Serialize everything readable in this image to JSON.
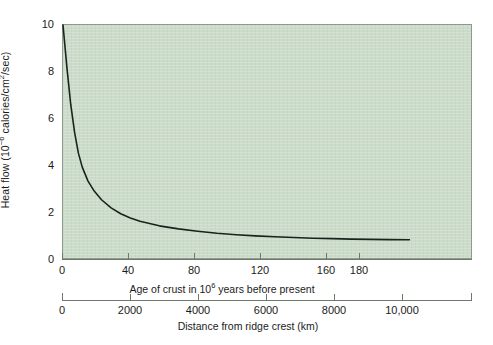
{
  "figure": {
    "background_color": "#ffffff",
    "plot_background_color": "#ccdccb",
    "curve_color": "#18231c",
    "axis_color": "#6d7a6c"
  },
  "chart_data": {
    "type": "line",
    "title": "",
    "xlabel": "Age of crust in 10^6 years before present",
    "ylabel": "Heat flow (10^-6 calories/cm^2/sec)",
    "xlim": [
      0,
      212
    ],
    "ylim": [
      0,
      10
    ],
    "grid": false,
    "legend": null,
    "x_axes": [
      {
        "name": "age",
        "label_plain": "Age of crust in 10",
        "label_sup": "6",
        "label_tail": " years before present",
        "label_full": "Age of crust in 10⁶ years before present",
        "unit": "10^6 years",
        "ticks": [
          0,
          40,
          80,
          120,
          160,
          180
        ],
        "tick_labels": [
          "0",
          "40",
          "80",
          "120",
          "160",
          "180"
        ],
        "range": [
          0,
          212
        ]
      },
      {
        "name": "distance",
        "label_full": "Distance from ridge crest (km)",
        "unit": "km",
        "ticks": [
          0,
          2000,
          4000,
          6000,
          8000,
          10000
        ],
        "tick_labels": [
          "0",
          "2000",
          "4000",
          "6000",
          "8000",
          "10,000"
        ],
        "range": [
          0,
          12100
        ]
      }
    ],
    "y_axis": {
      "label_plain": "Heat flow (10",
      "label_sup": "−6",
      "label_tail": " calories/cm",
      "label_sup2": "2",
      "label_tail2": "/sec)",
      "label_full": "Heat flow (10⁻⁶ calories/cm²/sec)",
      "ticks": [
        0,
        2,
        4,
        6,
        8,
        10
      ],
      "tick_labels": [
        "0",
        "2",
        "4",
        "6",
        "8",
        "10"
      ],
      "range": [
        0,
        10
      ]
    },
    "series": [
      {
        "name": "Heat flow vs age of crust",
        "x": [
          0,
          2,
          4,
          6,
          8,
          10,
          13,
          16,
          20,
          25,
          30,
          35,
          40,
          50,
          60,
          70,
          80,
          90,
          100,
          110,
          120,
          130,
          140,
          150,
          160,
          170,
          180
        ],
        "y": [
          10.0,
          8.2,
          6.6,
          5.4,
          4.5,
          3.9,
          3.3,
          2.9,
          2.5,
          2.15,
          1.9,
          1.72,
          1.58,
          1.38,
          1.25,
          1.15,
          1.06,
          1.0,
          0.95,
          0.91,
          0.88,
          0.85,
          0.83,
          0.81,
          0.8,
          0.79,
          0.78
        ]
      }
    ]
  }
}
